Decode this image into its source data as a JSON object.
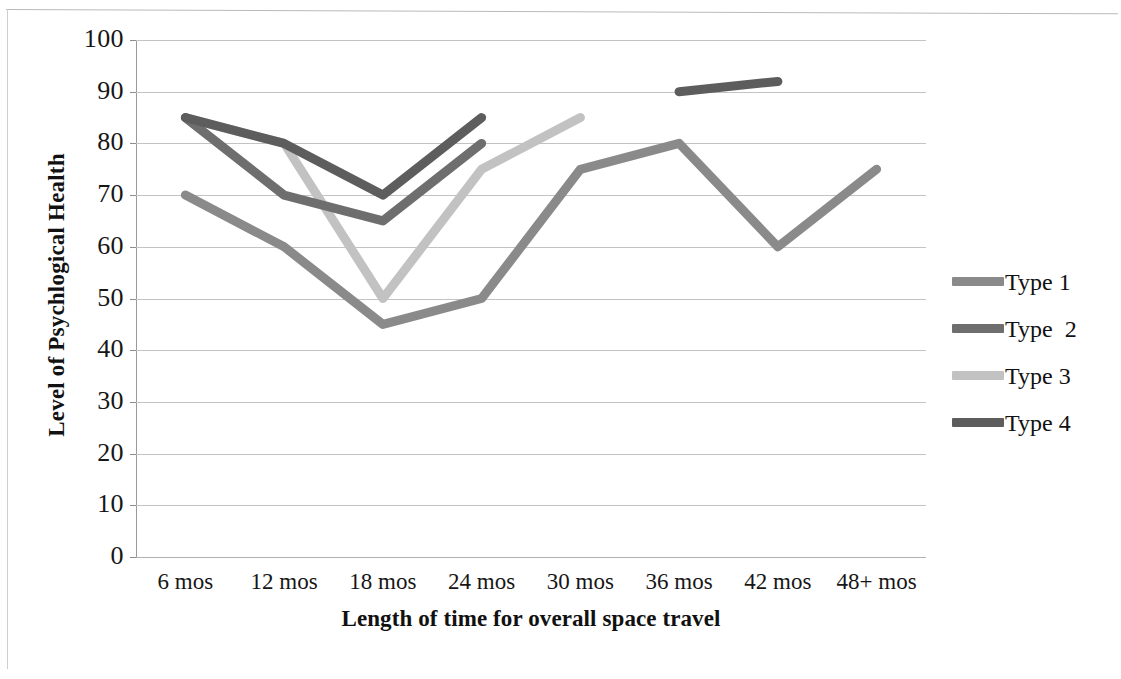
{
  "chart_data": {
    "type": "line",
    "title": "",
    "xlabel": "Length of time for overall space travel",
    "ylabel": "Level of Psychlogical Health",
    "categories": [
      "6 mos",
      "12 mos",
      "18 mos",
      "24 mos",
      "30 mos",
      "36 mos",
      "42 mos",
      "48+ mos"
    ],
    "ylim": [
      0,
      100
    ],
    "y_ticks": [
      100,
      90,
      80,
      70,
      60,
      50,
      40,
      30,
      20,
      10,
      0
    ],
    "grid": true,
    "legend_position": "right",
    "series": [
      {
        "name": "Type 1",
        "color": "#8a8a8a",
        "values": [
          70,
          60,
          45,
          50,
          75,
          80,
          60,
          75
        ]
      },
      {
        "name": "Type  2",
        "color": "#6e6e6e",
        "values": [
          85,
          70,
          65,
          80,
          null,
          null,
          null,
          null
        ]
      },
      {
        "name": "Type 3",
        "color": "#c2c2c2",
        "values": [
          85,
          80,
          50,
          75,
          85,
          null,
          null,
          null
        ]
      },
      {
        "name": "Type 4",
        "color": "#5d5d5d",
        "values": [
          85,
          80,
          70,
          85,
          null,
          90,
          92,
          null
        ]
      }
    ]
  },
  "axes": {
    "y_title": "Level of Psychlogical Health",
    "x_title": "Length of time for overall space travel",
    "y_tick_labels": [
      "100",
      "90",
      "80",
      "70",
      "60",
      "50",
      "40",
      "30",
      "20",
      "10",
      "0"
    ],
    "x_tick_labels": [
      "6 mos",
      "12 mos",
      "18 mos",
      "24 mos",
      "30 mos",
      "36 mos",
      "42 mos",
      "48+ mos"
    ]
  },
  "legend": {
    "items": [
      {
        "label": "Type 1",
        "color": "#8a8a8a"
      },
      {
        "label": "Type  2",
        "color": "#6e6e6e"
      },
      {
        "label": "Type 3",
        "color": "#c2c2c2"
      },
      {
        "label": "Type 4",
        "color": "#5d5d5d"
      }
    ]
  }
}
